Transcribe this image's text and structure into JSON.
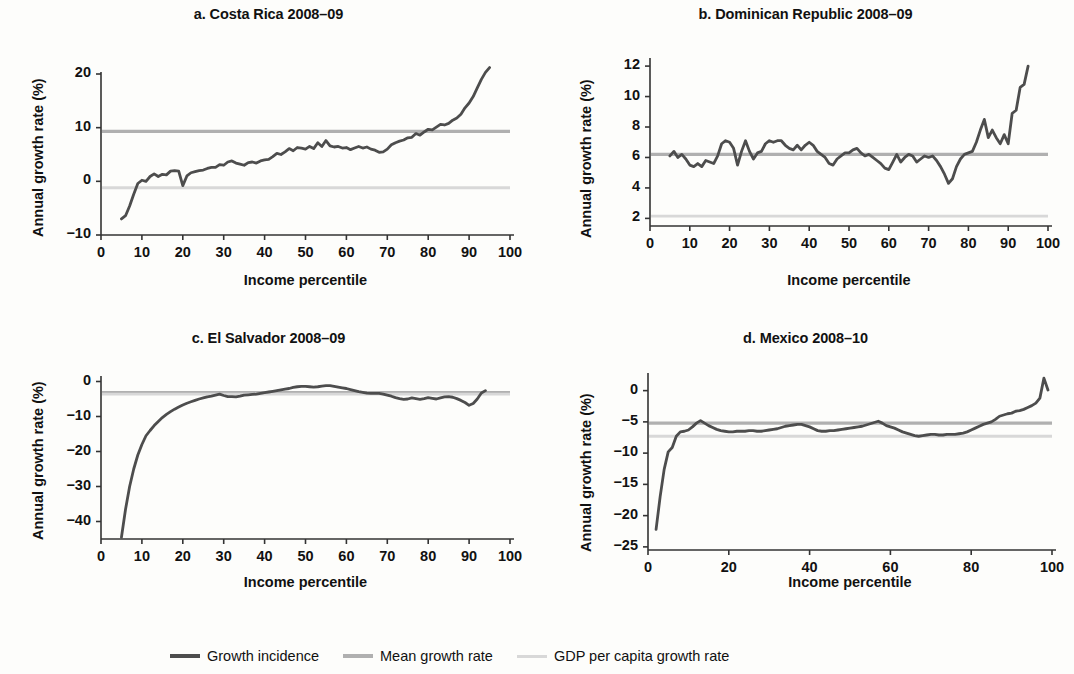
{
  "figure": {
    "background": "#fdfdfb",
    "series_colors": {
      "growth_incidence": "#4d4d4d",
      "mean_growth_rate": "#b0b0b0",
      "gdp_per_capita_growth_rate": "#d8d8d8"
    },
    "axis_color": "#333333"
  },
  "legend": {
    "position": "bottom-center",
    "items": [
      {
        "label": "Growth incidence",
        "color": "#4d4d4d",
        "width": 4.5
      },
      {
        "label": "Mean growth rate",
        "color": "#b0b0b0",
        "width": 3.5
      },
      {
        "label": "GDP per capita growth rate",
        "color": "#d8d8d8",
        "width": 3.0
      }
    ]
  },
  "chart_data": [
    {
      "id": "a",
      "type": "line",
      "title": "a. Costa Rica 2008–09",
      "xlabel": "Income percentile",
      "ylabel": "Annual growth rate (%)",
      "xlim": [
        0,
        100
      ],
      "ylim": [
        -10,
        20
      ],
      "xticks": [
        0,
        10,
        20,
        30,
        40,
        50,
        60,
        70,
        80,
        90,
        100
      ],
      "yticks": [
        -10,
        0,
        10,
        20
      ],
      "ytick_labels": [
        "−10",
        "0",
        "10",
        "20"
      ],
      "grid": false,
      "reference_lines": [
        {
          "name": "Mean growth rate",
          "value": 9.3,
          "color": "#b0b0b0"
        },
        {
          "name": "GDP per capita growth rate",
          "value": -1.2,
          "color": "#d8d8d8"
        }
      ],
      "series": [
        {
          "name": "Growth incidence",
          "color": "#4d4d4d",
          "x": [
            5,
            6,
            7,
            8,
            9,
            10,
            11,
            12,
            13,
            14,
            15,
            16,
            17,
            18,
            19,
            20,
            21,
            22,
            23,
            24,
            25,
            26,
            27,
            28,
            29,
            30,
            31,
            32,
            33,
            34,
            35,
            36,
            37,
            38,
            39,
            40,
            41,
            42,
            43,
            44,
            45,
            46,
            47,
            48,
            49,
            50,
            51,
            52,
            53,
            54,
            55,
            56,
            57,
            58,
            59,
            60,
            61,
            62,
            63,
            64,
            65,
            66,
            67,
            68,
            69,
            70,
            71,
            72,
            73,
            74,
            75,
            76,
            77,
            78,
            79,
            80,
            81,
            82,
            83,
            84,
            85,
            86,
            87,
            88,
            89,
            90,
            91,
            92,
            93,
            94,
            95
          ],
          "y": [
            -7.0,
            -6.4,
            -4.6,
            -2.4,
            -0.4,
            0.2,
            0.0,
            0.9,
            1.4,
            0.9,
            1.3,
            1.2,
            1.9,
            2.0,
            1.9,
            -0.8,
            1.0,
            1.6,
            1.8,
            2.0,
            2.1,
            2.4,
            2.6,
            2.6,
            3.1,
            3.0,
            3.6,
            3.8,
            3.4,
            3.2,
            3.0,
            3.5,
            3.6,
            3.4,
            3.8,
            4.0,
            4.1,
            4.6,
            5.2,
            5.0,
            5.5,
            6.1,
            5.7,
            6.3,
            6.2,
            6.0,
            6.5,
            6.1,
            7.2,
            6.5,
            7.6,
            6.6,
            6.4,
            6.5,
            6.2,
            6.3,
            5.9,
            6.2,
            6.5,
            6.2,
            6.4,
            6.0,
            5.8,
            5.4,
            5.5,
            6.0,
            6.8,
            7.2,
            7.5,
            7.7,
            8.1,
            8.2,
            8.9,
            8.6,
            9.2,
            9.7,
            9.6,
            10.1,
            10.6,
            10.5,
            10.8,
            11.4,
            11.8,
            12.5,
            13.7,
            14.6,
            15.8,
            17.4,
            19.0,
            20.3,
            21.2
          ]
        }
      ]
    },
    {
      "id": "b",
      "type": "line",
      "title": "b. Dominican Republic 2008–09",
      "xlabel": "Income percentile",
      "ylabel": "Annual growth rate (%)",
      "xlim": [
        0,
        100
      ],
      "ylim": [
        1.5,
        12.4
      ],
      "xticks": [
        0,
        10,
        20,
        30,
        40,
        50,
        60,
        70,
        80,
        90,
        100
      ],
      "yticks": [
        2,
        4,
        6,
        8,
        10,
        12
      ],
      "ytick_labels": [
        "2",
        "4",
        "6",
        "8",
        "10",
        "12"
      ],
      "grid": false,
      "reference_lines": [
        {
          "name": "Mean growth rate",
          "value": 6.2,
          "color": "#b0b0b0"
        },
        {
          "name": "GDP per capita growth rate",
          "value": 2.15,
          "color": "#d8d8d8"
        }
      ],
      "series": [
        {
          "name": "Growth incidence",
          "color": "#4d4d4d",
          "x": [
            5,
            6,
            7,
            8,
            9,
            10,
            11,
            12,
            13,
            14,
            15,
            16,
            17,
            18,
            19,
            20,
            21,
            22,
            23,
            24,
            25,
            26,
            27,
            28,
            29,
            30,
            31,
            32,
            33,
            34,
            35,
            36,
            37,
            38,
            39,
            40,
            41,
            42,
            43,
            44,
            45,
            46,
            47,
            48,
            49,
            50,
            51,
            52,
            53,
            54,
            55,
            56,
            57,
            58,
            59,
            60,
            61,
            62,
            63,
            64,
            65,
            66,
            67,
            68,
            69,
            70,
            71,
            72,
            73,
            74,
            75,
            76,
            77,
            78,
            79,
            80,
            81,
            82,
            83,
            84,
            85,
            86,
            87,
            88,
            89,
            90,
            91,
            92,
            93,
            94,
            95
          ],
          "y": [
            6.1,
            6.4,
            6.0,
            6.2,
            5.9,
            5.5,
            5.4,
            5.6,
            5.4,
            5.8,
            5.7,
            5.6,
            6.1,
            6.9,
            7.1,
            7.0,
            6.6,
            5.5,
            6.4,
            7.1,
            6.4,
            5.9,
            6.3,
            6.4,
            6.9,
            7.1,
            7.0,
            7.1,
            7.1,
            6.8,
            6.6,
            6.5,
            6.8,
            6.5,
            6.8,
            7.0,
            6.8,
            6.4,
            6.2,
            6.0,
            5.6,
            5.5,
            5.9,
            6.1,
            6.3,
            6.3,
            6.5,
            6.6,
            6.3,
            6.1,
            6.2,
            6.0,
            5.8,
            5.6,
            5.3,
            5.2,
            5.7,
            6.2,
            5.7,
            6.0,
            6.2,
            6.1,
            5.7,
            5.9,
            6.1,
            6.0,
            6.1,
            5.8,
            5.4,
            4.9,
            4.3,
            4.6,
            5.4,
            5.9,
            6.2,
            6.3,
            6.4,
            7.0,
            7.8,
            8.5,
            7.3,
            7.8,
            7.3,
            6.9,
            7.5,
            6.9,
            8.9,
            9.1,
            10.6,
            10.8,
            12.0
          ]
        }
      ]
    },
    {
      "id": "c",
      "type": "line",
      "title": "c. El Salvador 2008–09",
      "xlabel": "Income percentile",
      "ylabel": "Annual growth rate (%)",
      "xlim": [
        0,
        100
      ],
      "ylim": [
        -45,
        1
      ],
      "xticks": [
        0,
        10,
        20,
        30,
        40,
        50,
        60,
        70,
        80,
        90,
        100
      ],
      "yticks": [
        -40,
        -30,
        -20,
        -10,
        0
      ],
      "ytick_labels": [
        "−40",
        "−30",
        "−20",
        "−10",
        "0"
      ],
      "grid": false,
      "reference_lines": [
        {
          "name": "Mean growth rate",
          "value": -3.2,
          "color": "#b0b0b0"
        },
        {
          "name": "GDP per capita growth rate",
          "value": -3.6,
          "color": "#d8d8d8"
        }
      ],
      "series": [
        {
          "name": "Growth incidence",
          "color": "#4d4d4d",
          "x": [
            5,
            6,
            7,
            8,
            9,
            10,
            11,
            12,
            13,
            14,
            15,
            16,
            17,
            18,
            19,
            20,
            21,
            22,
            23,
            24,
            25,
            26,
            27,
            28,
            29,
            30,
            31,
            32,
            33,
            34,
            35,
            36,
            37,
            38,
            39,
            40,
            41,
            42,
            43,
            44,
            45,
            46,
            47,
            48,
            49,
            50,
            51,
            52,
            53,
            54,
            55,
            56,
            57,
            58,
            59,
            60,
            61,
            62,
            63,
            64,
            65,
            66,
            67,
            68,
            69,
            70,
            71,
            72,
            73,
            74,
            75,
            76,
            77,
            78,
            79,
            80,
            81,
            82,
            83,
            84,
            85,
            86,
            87,
            88,
            89,
            90,
            91,
            92,
            93,
            94
          ],
          "y": [
            -44.5,
            -36.5,
            -30.0,
            -25.0,
            -21.0,
            -18.0,
            -15.5,
            -14.0,
            -12.6,
            -11.4,
            -10.3,
            -9.4,
            -8.6,
            -7.9,
            -7.3,
            -6.7,
            -6.2,
            -5.8,
            -5.4,
            -5.0,
            -4.7,
            -4.4,
            -4.2,
            -3.9,
            -3.6,
            -4.0,
            -4.3,
            -4.3,
            -4.4,
            -4.2,
            -3.9,
            -3.8,
            -3.7,
            -3.6,
            -3.4,
            -3.2,
            -3.0,
            -2.8,
            -2.6,
            -2.4,
            -2.2,
            -2.0,
            -1.7,
            -1.5,
            -1.4,
            -1.4,
            -1.5,
            -1.6,
            -1.5,
            -1.3,
            -1.2,
            -1.2,
            -1.4,
            -1.6,
            -1.8,
            -2.0,
            -2.3,
            -2.6,
            -2.9,
            -3.1,
            -3.3,
            -3.4,
            -3.4,
            -3.4,
            -3.6,
            -3.9,
            -4.2,
            -4.6,
            -4.9,
            -5.1,
            -5.0,
            -4.7,
            -4.9,
            -5.1,
            -4.9,
            -4.6,
            -4.8,
            -5.0,
            -4.7,
            -4.4,
            -4.3,
            -4.5,
            -4.9,
            -5.4,
            -6.0,
            -6.8,
            -6.3,
            -5.0,
            -3.3,
            -2.6
          ]
        }
      ]
    },
    {
      "id": "d",
      "type": "line",
      "title": "d. Mexico 2008–10",
      "xlabel": "Income percentile",
      "ylabel": "Annual growth rate (%)",
      "xlim": [
        0,
        100
      ],
      "ylim": [
        -25.5,
        2.5
      ],
      "xticks": [
        0,
        20,
        40,
        60,
        80,
        100
      ],
      "yticks": [
        -25,
        -20,
        -15,
        -10,
        -5,
        0
      ],
      "ytick_labels": [
        "−25",
        "−20",
        "−15",
        "−10",
        "−5",
        "0"
      ],
      "grid": false,
      "reference_lines": [
        {
          "name": "Mean growth rate",
          "value": -5.2,
          "color": "#b0b0b0"
        },
        {
          "name": "GDP per capita growth rate",
          "value": -7.3,
          "color": "#d8d8d8"
        }
      ],
      "series": [
        {
          "name": "Growth incidence",
          "color": "#4d4d4d",
          "x": [
            2,
            3,
            4,
            5,
            6,
            7,
            8,
            9,
            10,
            11,
            12,
            13,
            14,
            15,
            16,
            17,
            18,
            19,
            20,
            21,
            22,
            23,
            24,
            25,
            26,
            27,
            28,
            29,
            30,
            31,
            32,
            33,
            34,
            35,
            36,
            37,
            38,
            39,
            40,
            41,
            42,
            43,
            44,
            45,
            46,
            47,
            48,
            49,
            50,
            51,
            52,
            53,
            54,
            55,
            56,
            57,
            58,
            59,
            60,
            61,
            62,
            63,
            64,
            65,
            66,
            67,
            68,
            69,
            70,
            71,
            72,
            73,
            74,
            75,
            76,
            77,
            78,
            79,
            80,
            81,
            82,
            83,
            84,
            85,
            86,
            87,
            88,
            89,
            90,
            91,
            92,
            93,
            94,
            95,
            96,
            97,
            98,
            99
          ],
          "y": [
            -22.2,
            -17.0,
            -12.6,
            -9.8,
            -9.1,
            -7.3,
            -6.6,
            -6.5,
            -6.3,
            -5.8,
            -5.2,
            -4.8,
            -5.2,
            -5.6,
            -5.9,
            -6.2,
            -6.4,
            -6.5,
            -6.6,
            -6.6,
            -6.5,
            -6.5,
            -6.5,
            -6.4,
            -6.4,
            -6.5,
            -6.5,
            -6.4,
            -6.3,
            -6.2,
            -6.1,
            -5.9,
            -5.7,
            -5.6,
            -5.5,
            -5.4,
            -5.4,
            -5.6,
            -5.8,
            -6.1,
            -6.4,
            -6.5,
            -6.5,
            -6.4,
            -6.4,
            -6.3,
            -6.2,
            -6.1,
            -6.0,
            -5.9,
            -5.8,
            -5.7,
            -5.5,
            -5.3,
            -5.1,
            -4.9,
            -5.2,
            -5.6,
            -5.8,
            -6.0,
            -6.3,
            -6.6,
            -6.8,
            -7.0,
            -7.2,
            -7.3,
            -7.2,
            -7.1,
            -7.0,
            -7.0,
            -7.1,
            -7.1,
            -7.0,
            -7.0,
            -7.0,
            -6.9,
            -6.8,
            -6.6,
            -6.3,
            -6.0,
            -5.7,
            -5.4,
            -5.2,
            -5.0,
            -4.6,
            -4.1,
            -3.9,
            -3.7,
            -3.6,
            -3.3,
            -3.2,
            -3.0,
            -2.7,
            -2.4,
            -2.0,
            -1.2,
            2.0,
            0.1
          ]
        }
      ]
    }
  ]
}
